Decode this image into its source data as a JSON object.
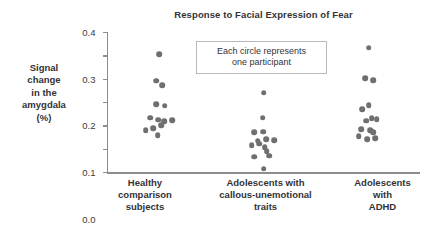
{
  "chart_data": {
    "type": "scatter",
    "title": "Response to Facial Expression of Fear",
    "xlabel": "",
    "ylabel": "Signal change in the amygdala (%)",
    "ylim": [
      -0.2,
      0.4
    ],
    "yticks": [
      "0.4",
      "0.3",
      "0.2",
      "0.1",
      "0.0",
      "–0.1",
      "–0.2"
    ],
    "ytick_values": [
      0.4,
      0.3,
      0.2,
      0.1,
      0.0,
      -0.1,
      -0.2
    ],
    "grid": false,
    "legend": null,
    "annotations": [
      {
        "name": "each-circle-note",
        "line1": "Each circle represents",
        "line2": "one participant"
      }
    ],
    "categories": [
      {
        "lines": [
          "Healthy",
          "comparison",
          "subjects"
        ]
      },
      {
        "lines": [
          "Adolescents with",
          "callous-unemotional",
          "traits"
        ]
      },
      {
        "lines": [
          "Adolescents",
          "with",
          "ADHD"
        ]
      }
    ],
    "series": [
      {
        "name": "Healthy comparison subjects",
        "points": [
          {
            "jitter": 0.5,
            "value": 0.305
          },
          {
            "jitter": 0.44,
            "value": 0.192
          },
          {
            "jitter": 0.56,
            "value": 0.172
          },
          {
            "jitter": 0.44,
            "value": 0.09
          },
          {
            "jitter": 0.62,
            "value": 0.085
          },
          {
            "jitter": 0.3,
            "value": 0.032
          },
          {
            "jitter": 0.48,
            "value": 0.024
          },
          {
            "jitter": 0.61,
            "value": 0.017
          },
          {
            "jitter": 0.78,
            "value": 0.021
          },
          {
            "jitter": 0.37,
            "value": -0.012
          },
          {
            "jitter": 0.55,
            "value": 0.0
          },
          {
            "jitter": 0.21,
            "value": -0.022
          },
          {
            "jitter": 0.47,
            "value": -0.043
          }
        ]
      },
      {
        "name": "Adolescents with callous-unemotional traits",
        "points": [
          {
            "jitter": 0.5,
            "value": 0.14
          },
          {
            "jitter": 0.48,
            "value": 0.032
          },
          {
            "jitter": 0.3,
            "value": -0.03
          },
          {
            "jitter": 0.49,
            "value": -0.028
          },
          {
            "jitter": 0.37,
            "value": -0.065
          },
          {
            "jitter": 0.56,
            "value": -0.06
          },
          {
            "jitter": 0.73,
            "value": -0.063
          },
          {
            "jitter": 0.24,
            "value": -0.086
          },
          {
            "jitter": 0.41,
            "value": -0.078
          },
          {
            "jitter": 0.53,
            "value": -0.093
          },
          {
            "jitter": 0.57,
            "value": -0.111
          },
          {
            "jitter": 0.3,
            "value": -0.134
          },
          {
            "jitter": 0.62,
            "value": -0.131
          },
          {
            "jitter": 0.5,
            "value": -0.186
          }
        ]
      },
      {
        "name": "Adolescents with ADHD",
        "points": [
          {
            "jitter": 0.52,
            "value": 0.333
          },
          {
            "jitter": 0.44,
            "value": 0.203
          },
          {
            "jitter": 0.62,
            "value": 0.193
          },
          {
            "jitter": 0.38,
            "value": 0.068
          },
          {
            "jitter": 0.52,
            "value": 0.087
          },
          {
            "jitter": 0.58,
            "value": 0.03
          },
          {
            "jitter": 0.47,
            "value": 0.019
          },
          {
            "jitter": 0.69,
            "value": 0.026
          },
          {
            "jitter": 0.35,
            "value": -0.016
          },
          {
            "jitter": 0.55,
            "value": -0.022
          },
          {
            "jitter": 0.62,
            "value": -0.03
          },
          {
            "jitter": 0.3,
            "value": -0.046
          },
          {
            "jitter": 0.48,
            "value": -0.06
          },
          {
            "jitter": 0.66,
            "value": -0.055
          }
        ]
      }
    ],
    "colors": {
      "dot": "#6f6f72",
      "axis": "#8d8d90",
      "text": "#333336",
      "background": "#ffffff"
    }
  }
}
